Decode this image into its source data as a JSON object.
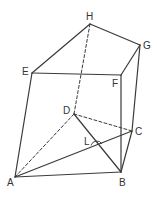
{
  "diagram": {
    "type": "prism-3d",
    "colors": {
      "line": "#3a3a3a",
      "label": "#333333",
      "background": "#ffffff"
    },
    "vertices": {
      "A": {
        "label": "A",
        "x": 15,
        "y": 177,
        "lx": 7,
        "ly": 186
      },
      "B": {
        "label": "B",
        "x": 121,
        "y": 172,
        "lx": 119,
        "ly": 186
      },
      "C": {
        "label": "C",
        "x": 132,
        "y": 131,
        "lx": 135,
        "ly": 135
      },
      "D": {
        "label": "D",
        "x": 74,
        "y": 114,
        "lx": 63,
        "ly": 114
      },
      "E": {
        "label": "E",
        "x": 32,
        "y": 73,
        "lx": 22,
        "ly": 75
      },
      "F": {
        "label": "F",
        "x": 121,
        "y": 75,
        "lx": 112,
        "ly": 87
      },
      "G": {
        "label": "G",
        "x": 140,
        "y": 45,
        "lx": 143,
        "ly": 49
      },
      "H": {
        "label": "H",
        "x": 90,
        "y": 24,
        "lx": 86,
        "ly": 20
      }
    },
    "point_L": {
      "label": "L",
      "x": 96,
      "y": 143,
      "lx": 84,
      "ly": 145
    },
    "edges_solid": [
      [
        "E",
        "H"
      ],
      [
        "H",
        "G"
      ],
      [
        "E",
        "F"
      ],
      [
        "F",
        "G"
      ],
      [
        "E",
        "A"
      ],
      [
        "F",
        "B"
      ],
      [
        "G",
        "C"
      ],
      [
        "A",
        "B"
      ],
      [
        "B",
        "C"
      ],
      [
        "A",
        "C"
      ],
      [
        "D",
        "B"
      ]
    ],
    "edges_dashed": [
      [
        "H",
        "D"
      ],
      [
        "A",
        "D"
      ],
      [
        "D",
        "C"
      ]
    ]
  }
}
